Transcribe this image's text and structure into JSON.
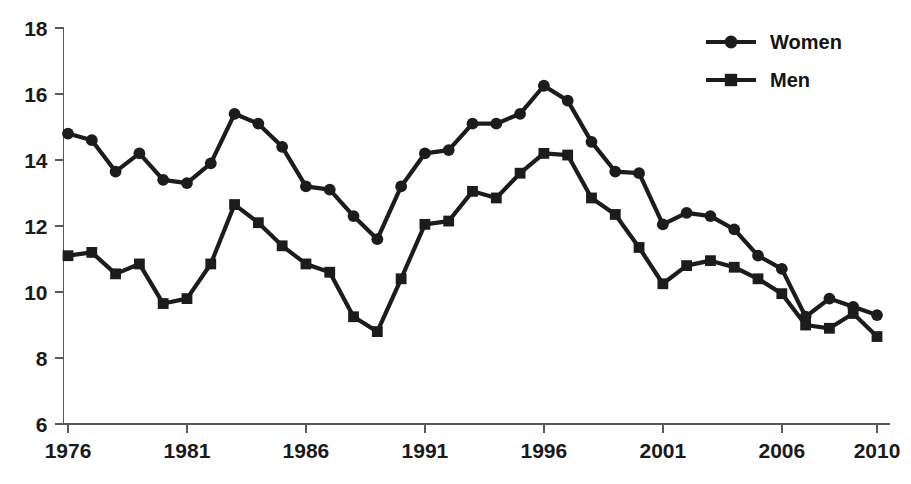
{
  "chart_data": {
    "type": "line",
    "title": "",
    "subtitle": "",
    "xlabel": "",
    "ylabel": "",
    "x": [
      1976,
      1977,
      1978,
      1979,
      1980,
      1981,
      1982,
      1983,
      1984,
      1985,
      1986,
      1987,
      1988,
      1989,
      1990,
      1991,
      1992,
      1993,
      1994,
      1995,
      1996,
      1997,
      1998,
      1999,
      2000,
      2001,
      2002,
      2003,
      2004,
      2005,
      2006,
      2007,
      2008,
      2009,
      2010
    ],
    "xlim": [
      1976,
      2010
    ],
    "ylim": [
      6,
      18
    ],
    "xticks": [
      1976,
      1981,
      1986,
      1991,
      1996,
      2001,
      2006,
      2010
    ],
    "xtick_labels": [
      "1976",
      "1981",
      "1986",
      "1991",
      "1996",
      "2001",
      "2006",
      "2010"
    ],
    "yticks": [
      6,
      8,
      10,
      12,
      14,
      16,
      18
    ],
    "ytick_labels": [
      "6",
      "8",
      "10",
      "12",
      "14",
      "16",
      "18"
    ],
    "grid": false,
    "legend_position": "top-right",
    "series": [
      {
        "name": "Women",
        "marker": "circle",
        "color": "#1c1c1c",
        "values": [
          14.8,
          14.6,
          13.65,
          14.2,
          13.4,
          13.3,
          13.9,
          15.4,
          15.1,
          14.4,
          13.2,
          13.1,
          12.3,
          11.6,
          13.2,
          14.2,
          14.3,
          15.1,
          15.1,
          15.4,
          16.25,
          15.8,
          14.55,
          13.65,
          13.6,
          12.05,
          12.4,
          12.3,
          11.9,
          11.1,
          10.7,
          9.25,
          9.8,
          9.55,
          9.3
        ]
      },
      {
        "name": "Men",
        "marker": "square",
        "color": "#1c1c1c",
        "values": [
          11.1,
          11.2,
          10.55,
          10.85,
          9.65,
          9.8,
          10.85,
          12.65,
          12.1,
          11.4,
          10.85,
          10.6,
          9.25,
          8.8,
          10.4,
          12.05,
          12.15,
          13.05,
          12.85,
          13.6,
          14.2,
          14.15,
          12.85,
          12.35,
          11.35,
          10.25,
          10.8,
          10.95,
          10.75,
          10.4,
          9.95,
          9.0,
          8.9,
          9.35,
          8.65
        ]
      }
    ],
    "annotations": []
  },
  "legend": {
    "items": [
      {
        "label": "Women",
        "marker": "circle"
      },
      {
        "label": "Men",
        "marker": "square"
      }
    ]
  },
  "colors": {
    "series": "#1c1c1c",
    "axis": "#595959",
    "text": "#1a1a1a",
    "background": "#ffffff"
  }
}
